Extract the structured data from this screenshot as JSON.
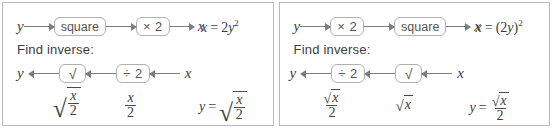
{
  "figure": {
    "type": "function-machine-diagram",
    "panel_count": 2,
    "border_color": "#b9b9b9",
    "ink_color": "#4a4a4a"
  },
  "panels": [
    {
      "id": "left",
      "forward": {
        "input_label": "y",
        "boxes": [
          "square",
          "× 2"
        ],
        "output_label": "x",
        "equation_lhs": "x",
        "equation_eq": "=",
        "equation_coefficient": "2",
        "equation_base": "y",
        "equation_exponent": "2",
        "equation_plain": "x = 2y²"
      },
      "prompt": "Find inverse:",
      "inverse": {
        "output_label": "y",
        "boxes": [
          "√",
          "÷ 2"
        ],
        "input_label": "x"
      },
      "intermediate": [
        {
          "kind": "radical-fraction",
          "numerator": "x",
          "denominator": "2",
          "plain": "√(x/2)"
        },
        {
          "kind": "fraction",
          "numerator": "x",
          "denominator": "2",
          "plain": "x/2"
        }
      ],
      "answer": {
        "lhs": "y",
        "eq": "=",
        "kind": "radical-fraction",
        "numerator": "x",
        "denominator": "2",
        "plain": "y = √(x/2)"
      }
    },
    {
      "id": "right",
      "forward": {
        "input_label": "y",
        "boxes": [
          "× 2",
          "square"
        ],
        "output_label": "x",
        "equation_lhs": "x",
        "equation_eq": "=",
        "equation_open": "(2",
        "equation_base": "y",
        "equation_close": ")",
        "equation_exponent": "2",
        "equation_plain": "x = (2y)²"
      },
      "prompt": "Find inverse:",
      "inverse": {
        "output_label": "y",
        "boxes": [
          "÷ 2",
          "√"
        ],
        "input_label": "x"
      },
      "intermediate": [
        {
          "kind": "fraction-of-radical",
          "numerator": "x",
          "denominator": "2",
          "plain": "√x/2"
        },
        {
          "kind": "radical",
          "radicand": "x",
          "plain": "√x"
        }
      ],
      "answer": {
        "lhs": "y",
        "eq": "=",
        "kind": "fraction-of-radical",
        "numerator": "x",
        "denominator": "2",
        "plain": "y = √x/2"
      }
    }
  ]
}
